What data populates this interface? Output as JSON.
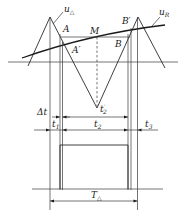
{
  "diagram": {
    "type": "pwm-triangle-comparison",
    "labels": {
      "u_tri": {
        "main": "u",
        "sub": "△"
      },
      "u_R": {
        "main": "u",
        "sub": "R"
      },
      "A": "A",
      "A_prime": "A′",
      "M": "M",
      "B": "B",
      "B_prime": "B′",
      "t2_prime": {
        "main": "t",
        "sub": "2",
        "sup": "′"
      },
      "delta_t": "Δt",
      "t1": {
        "main": "t",
        "sub": "1"
      },
      "t2": {
        "main": "t",
        "sub": "2"
      },
      "t3": {
        "main": "t",
        "sub": "3"
      },
      "T_tri": {
        "main": "T",
        "sub": "△"
      }
    },
    "colors": {
      "line": "#2a2a2a",
      "background": "#ffffff"
    }
  }
}
